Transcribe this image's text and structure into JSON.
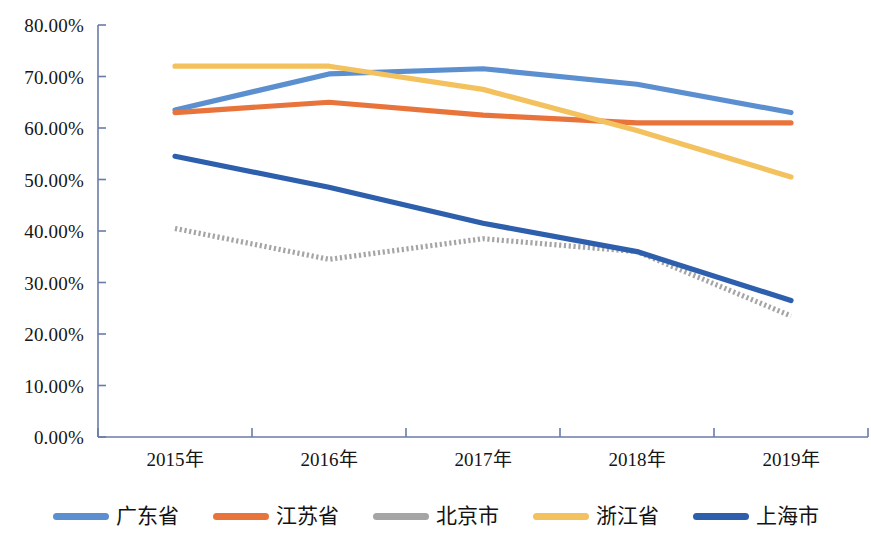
{
  "chart_data": {
    "type": "line",
    "title": "",
    "xlabel": "",
    "ylabel": "",
    "categories": [
      "2015年",
      "2016年",
      "2017年",
      "2018年",
      "2019年"
    ],
    "ylim": [
      0,
      0.8
    ],
    "ytick_labels": [
      "0.00%",
      "10.00%",
      "20.00%",
      "30.00%",
      "40.00%",
      "50.00%",
      "60.00%",
      "70.00%",
      "80.00%"
    ],
    "ytick_values": [
      0,
      10,
      20,
      30,
      40,
      50,
      60,
      70,
      80
    ],
    "grid": false,
    "legend_position": "bottom",
    "series": [
      {
        "name": "广东省",
        "color": "#5B8FD0",
        "style": "solid",
        "values": [
          63.5,
          70.5,
          71.5,
          68.5,
          63.0
        ]
      },
      {
        "name": "江苏省",
        "color": "#E8743B",
        "style": "solid",
        "values": [
          63.0,
          65.0,
          62.5,
          61.0,
          61.0
        ]
      },
      {
        "name": "北京市",
        "color": "#A5A5A5",
        "style": "dotted",
        "values": [
          40.5,
          34.5,
          38.5,
          36.0,
          23.5
        ]
      },
      {
        "name": "浙江省",
        "color": "#F3C25E",
        "style": "solid",
        "values": [
          72.0,
          72.0,
          67.5,
          59.5,
          50.5
        ]
      },
      {
        "name": "上海市",
        "color": "#2E5FAC",
        "style": "solid",
        "values": [
          54.5,
          48.5,
          41.5,
          36.0,
          26.5
        ]
      }
    ]
  },
  "axes": {
    "axis_color": "#6A7BA8",
    "y_label_0": "0.00%",
    "y_label_1": "10.00%",
    "y_label_2": "20.00%",
    "y_label_3": "30.00%",
    "y_label_4": "40.00%",
    "y_label_5": "50.00%",
    "y_label_6": "60.00%",
    "y_label_7": "70.00%",
    "y_label_8": "80.00%",
    "x_label_0": "2015年",
    "x_label_1": "2016年",
    "x_label_2": "2017年",
    "x_label_3": "2018年",
    "x_label_4": "2019年"
  },
  "legend": {
    "items": [
      {
        "label": "广东省",
        "color": "#5B8FD0"
      },
      {
        "label": "江苏省",
        "color": "#E8743B"
      },
      {
        "label": "北京市",
        "color": "#A5A5A5"
      },
      {
        "label": "浙江省",
        "color": "#F3C25E"
      },
      {
        "label": "上海市",
        "color": "#2E5FAC"
      }
    ]
  }
}
